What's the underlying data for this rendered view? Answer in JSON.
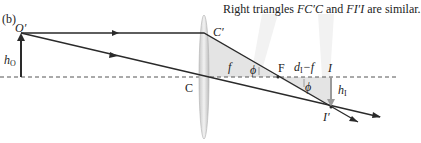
{
  "figure": {
    "panel_label": "(b)",
    "caption": {
      "prefix": "Right triangles ",
      "tri1": "FC′C",
      "mid": " and ",
      "tri2": "FI′I",
      "suffix": " are similar."
    },
    "labels": {
      "object_top": "O′",
      "object_height": "h",
      "object_height_sub": "O",
      "lens_top": "C′",
      "lens_center": "C",
      "focal_length": "f",
      "angle_left": "ϕ",
      "focal_point": "F",
      "image_distance_minus_f": "d",
      "image_distance_sub": "I",
      "image_distance_rest": "−f",
      "image_point": "I",
      "angle_right": "ϕ",
      "image_height": "h",
      "image_height_sub": "I",
      "image_top": "I′"
    },
    "colors": {
      "ray": "#2a2a2a",
      "axis": "#555555",
      "triangle_fill": "#e3e3e3",
      "lens_fill": "#d9d9d9",
      "image_arrow": "#9a9a9a",
      "beam": "#f3f3f3"
    }
  }
}
